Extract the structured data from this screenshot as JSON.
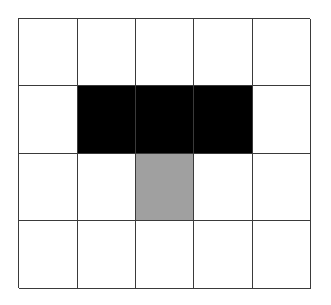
{
  "grid": {
    "rows": 4,
    "cols": 5,
    "colors": {
      "empty": "#ffffff",
      "black": "#000000",
      "gray": "#a0a0a0",
      "line": "#3a3a3a"
    },
    "cells": [
      [
        "empty",
        "empty",
        "empty",
        "empty",
        "empty"
      ],
      [
        "empty",
        "black",
        "black",
        "black",
        "empty"
      ],
      [
        "empty",
        "empty",
        "gray",
        "empty",
        "empty"
      ],
      [
        "empty",
        "empty",
        "empty",
        "empty",
        "empty"
      ]
    ]
  }
}
